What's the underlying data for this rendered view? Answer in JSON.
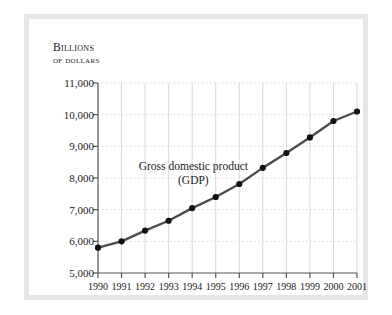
{
  "axis_title": {
    "line1": "Billions",
    "line2": "of dollars"
  },
  "chart_data": {
    "type": "line",
    "title": "",
    "annotation": {
      "line1": "Gross domestic product",
      "line2": "(GDP)"
    },
    "xlabel": "",
    "ylabel": "Billions of dollars",
    "categories": [
      "1990",
      "1991",
      "1992",
      "1993",
      "1994",
      "1995",
      "1996",
      "1997",
      "1998",
      "1999",
      "2000",
      "2001"
    ],
    "x": [
      1990,
      1991,
      1992,
      1993,
      1994,
      1995,
      1996,
      1997,
      1998,
      1999,
      2000,
      2001
    ],
    "values": [
      5800,
      6000,
      6340,
      6650,
      7050,
      7400,
      7810,
      8320,
      8790,
      9280,
      9800,
      10100
    ],
    "ylim": [
      5000,
      11000
    ],
    "yticks": [
      5000,
      6000,
      7000,
      8000,
      9000,
      10000,
      11000
    ],
    "ytick_labels": [
      "5,000",
      "6,000",
      "7,000",
      "8,000",
      "9,000",
      "10,000",
      "11,000"
    ],
    "grid": true,
    "grid_horizontal_style": "dotted",
    "grid_vertical_style": "solid",
    "legend": "none",
    "marker": "circle",
    "line_color": "#4d4d4d",
    "marker_color": "#111111",
    "grid_color": "#d8d8d8",
    "axis_color": "#555555",
    "frame_color": "#e6e6e6",
    "background": "#ffffff"
  }
}
